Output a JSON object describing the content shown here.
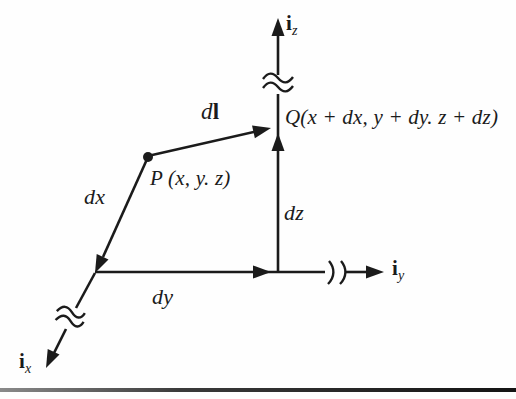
{
  "colors": {
    "ink": "#1b1b1b",
    "background": "#fefefe",
    "bottom_rule": "#141414"
  },
  "labels": {
    "axis_z": {
      "base": "i",
      "sub": "z"
    },
    "axis_y": {
      "base": "i",
      "sub": "y"
    },
    "axis_x": {
      "base": "i",
      "sub": "x"
    },
    "vector_dl": {
      "d": "d",
      "l": "l"
    },
    "point_p": "P (x, y. z)",
    "point_q": "Q(x + dx, y + dy. z + dz)",
    "seg_dx": "dx",
    "seg_dy": "dy",
    "seg_dz": "dz"
  }
}
